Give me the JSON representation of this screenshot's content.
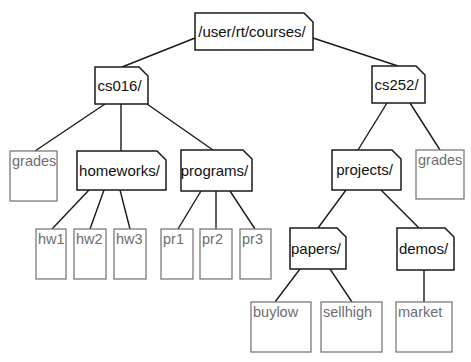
{
  "diagram": {
    "type": "tree",
    "description_colors": {
      "directory_stroke": "#1a1a1a",
      "file_stroke": "#7a7a7a",
      "file_text": "#6e6e6e",
      "directory_text": "#111111"
    },
    "nodes": [
      {
        "id": "root",
        "label": "/user/rt/courses/",
        "kind": "directory",
        "x": 195,
        "y": 13,
        "w": 118,
        "h": 37
      },
      {
        "id": "cs016",
        "label": "cs016/",
        "kind": "directory",
        "x": 95,
        "y": 67,
        "w": 53,
        "h": 37
      },
      {
        "id": "cs252",
        "label": "cs252/",
        "kind": "directory",
        "x": 372,
        "y": 66,
        "w": 53,
        "h": 37
      },
      {
        "id": "grades1",
        "label": "grades",
        "kind": "file",
        "x": 10,
        "y": 151,
        "w": 47,
        "h": 50
      },
      {
        "id": "homeworks",
        "label": "homeworks/",
        "kind": "directory",
        "x": 77,
        "y": 151,
        "w": 89,
        "h": 39
      },
      {
        "id": "programs",
        "label": "programs/",
        "kind": "directory",
        "x": 181,
        "y": 150,
        "w": 71,
        "h": 41
      },
      {
        "id": "projects",
        "label": "projects/",
        "kind": "directory",
        "x": 332,
        "y": 150,
        "w": 69,
        "h": 40
      },
      {
        "id": "grades2",
        "label": "grades",
        "kind": "file",
        "x": 416,
        "y": 150,
        "w": 48,
        "h": 49
      },
      {
        "id": "hw1",
        "label": "hw1",
        "kind": "file",
        "x": 36,
        "y": 229,
        "w": 30,
        "h": 50
      },
      {
        "id": "hw2",
        "label": "hw2",
        "kind": "file",
        "x": 74,
        "y": 229,
        "w": 32,
        "h": 50
      },
      {
        "id": "hw3",
        "label": "hw3",
        "kind": "file",
        "x": 114,
        "y": 229,
        "w": 32,
        "h": 50
      },
      {
        "id": "pr1",
        "label": "pr1",
        "kind": "file",
        "x": 161,
        "y": 229,
        "w": 32,
        "h": 50
      },
      {
        "id": "pr2",
        "label": "pr2",
        "kind": "file",
        "x": 200,
        "y": 229,
        "w": 32,
        "h": 50
      },
      {
        "id": "pr3",
        "label": "pr3",
        "kind": "file",
        "x": 240,
        "y": 229,
        "w": 31,
        "h": 50
      },
      {
        "id": "papers",
        "label": "papers/",
        "kind": "directory",
        "x": 290,
        "y": 228,
        "w": 56,
        "h": 41
      },
      {
        "id": "demos",
        "label": "demos/",
        "kind": "directory",
        "x": 397,
        "y": 228,
        "w": 57,
        "h": 42
      },
      {
        "id": "buylow",
        "label": "buylow",
        "kind": "file",
        "x": 251,
        "y": 302,
        "w": 60,
        "h": 50
      },
      {
        "id": "sellhigh",
        "label": "sellhigh",
        "kind": "file",
        "x": 321,
        "y": 302,
        "w": 61,
        "h": 50
      },
      {
        "id": "market",
        "label": "market",
        "kind": "file",
        "x": 396,
        "y": 302,
        "w": 56,
        "h": 50
      }
    ],
    "edges": [
      {
        "from": "root",
        "to": "cs016",
        "x1": 195,
        "y1": 38,
        "x2": 122,
        "y2": 67
      },
      {
        "from": "root",
        "to": "cs252",
        "x1": 313,
        "y1": 38,
        "x2": 398,
        "y2": 66
      },
      {
        "from": "cs016",
        "to": "grades1",
        "x1": 105,
        "y1": 104,
        "x2": 35,
        "y2": 151
      },
      {
        "from": "cs016",
        "to": "homeworks",
        "x1": 121,
        "y1": 104,
        "x2": 121,
        "y2": 151
      },
      {
        "from": "cs016",
        "to": "programs",
        "x1": 147,
        "y1": 104,
        "x2": 213,
        "y2": 150
      },
      {
        "from": "cs252",
        "to": "projects",
        "x1": 387,
        "y1": 103,
        "x2": 358,
        "y2": 150
      },
      {
        "from": "cs252",
        "to": "grades2",
        "x1": 410,
        "y1": 103,
        "x2": 440,
        "y2": 150
      },
      {
        "from": "homeworks",
        "to": "hw1",
        "x1": 89,
        "y1": 190,
        "x2": 52,
        "y2": 229
      },
      {
        "from": "homeworks",
        "to": "hw2",
        "x1": 104,
        "y1": 190,
        "x2": 90,
        "y2": 229
      },
      {
        "from": "homeworks",
        "to": "hw3",
        "x1": 120,
        "y1": 190,
        "x2": 130,
        "y2": 229
      },
      {
        "from": "programs",
        "to": "pr1",
        "x1": 201,
        "y1": 191,
        "x2": 178,
        "y2": 229
      },
      {
        "from": "programs",
        "to": "pr2",
        "x1": 216,
        "y1": 191,
        "x2": 216,
        "y2": 229
      },
      {
        "from": "programs",
        "to": "pr3",
        "x1": 230,
        "y1": 191,
        "x2": 255,
        "y2": 229
      },
      {
        "from": "projects",
        "to": "papers",
        "x1": 346,
        "y1": 190,
        "x2": 318,
        "y2": 228
      },
      {
        "from": "projects",
        "to": "demos",
        "x1": 381,
        "y1": 190,
        "x2": 419,
        "y2": 228
      },
      {
        "from": "papers",
        "to": "buylow",
        "x1": 300,
        "y1": 269,
        "x2": 275,
        "y2": 302
      },
      {
        "from": "papers",
        "to": "sellhigh",
        "x1": 330,
        "y1": 269,
        "x2": 352,
        "y2": 302
      },
      {
        "from": "demos",
        "to": "market",
        "x1": 424,
        "y1": 270,
        "x2": 424,
        "y2": 302
      }
    ]
  }
}
